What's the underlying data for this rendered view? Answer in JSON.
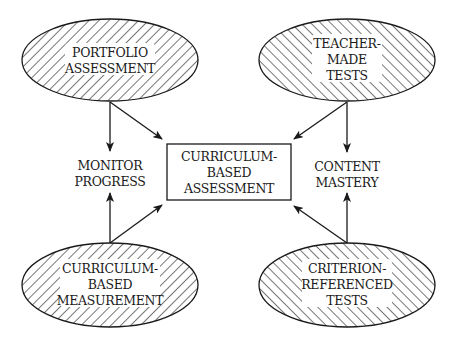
{
  "diagram": {
    "center_box": {
      "lines": [
        "CURRICULUM-",
        "BASED",
        "ASSESSMENT"
      ]
    },
    "nodes": {
      "portfolio": {
        "lines": [
          "PORTFOLIO",
          "ASSESSMENT"
        ],
        "hatch": "backslash"
      },
      "teacher_made": {
        "lines": [
          "TEACHER-",
          "MADE",
          "TESTS"
        ],
        "hatch": "slash"
      },
      "cbm": {
        "lines": [
          "CURRICULUM-",
          "BASED",
          "MEASUREMENT"
        ],
        "hatch": "backslash"
      },
      "criterion": {
        "lines": [
          "CRITERION-",
          "REFERENCED",
          "TESTS"
        ],
        "hatch": "slash"
      }
    },
    "outcomes": {
      "monitor_progress": {
        "lines": [
          "MONITOR",
          "PROGRESS"
        ]
      },
      "content_mastery": {
        "lines": [
          "CONTENT",
          "MASTERY"
        ]
      }
    },
    "edges": [
      {
        "from": "PORTFOLIO ASSESSMENT",
        "to": "MONITOR PROGRESS"
      },
      {
        "from": "PORTFOLIO ASSESSMENT",
        "to": "CURRICULUM-BASED ASSESSMENT"
      },
      {
        "from": "TEACHER-MADE TESTS",
        "to": "CONTENT MASTERY"
      },
      {
        "from": "TEACHER-MADE TESTS",
        "to": "CURRICULUM-BASED ASSESSMENT"
      },
      {
        "from": "CURRICULUM-BASED MEASUREMENT",
        "to": "MONITOR PROGRESS"
      },
      {
        "from": "CURRICULUM-BASED MEASUREMENT",
        "to": "CURRICULUM-BASED ASSESSMENT"
      },
      {
        "from": "CRITERION-REFERENCED TESTS",
        "to": "CONTENT MASTERY"
      },
      {
        "from": "CRITERION-REFERENCED TESTS",
        "to": "CURRICULUM-BASED ASSESSMENT"
      }
    ],
    "colors": {
      "ink": "#1a1a1a",
      "background": "#ffffff"
    }
  }
}
